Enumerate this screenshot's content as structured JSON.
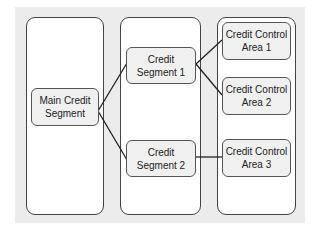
{
  "diagram": {
    "columns": [
      {
        "id": "level-1"
      },
      {
        "id": "level-2"
      },
      {
        "id": "level-3"
      }
    ],
    "nodes": {
      "main": {
        "label": "Main Credit\nSegment"
      },
      "seg1": {
        "label": "Credit\nSegment 1"
      },
      "seg2": {
        "label": "Credit\nSegment 2"
      },
      "cca1": {
        "label": "Credit Control\nArea 1"
      },
      "cca2": {
        "label": "Credit Control\nArea 2"
      },
      "cca3": {
        "label": "Credit Control\nArea 3"
      }
    },
    "edges": [
      [
        "main",
        "seg1"
      ],
      [
        "main",
        "seg2"
      ],
      [
        "seg1",
        "cca1"
      ],
      [
        "seg1",
        "cca2"
      ],
      [
        "seg2",
        "cca3"
      ]
    ]
  }
}
